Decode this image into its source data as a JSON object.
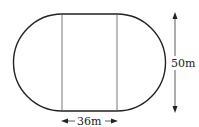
{
  "diagram": {
    "shape": "stadium (rectangle with semicircular ends)",
    "width_label": "36m",
    "height_label": "50m",
    "colors": {
      "stroke": "#222222",
      "inner_line": "#555555",
      "background": "#ffffff"
    }
  }
}
